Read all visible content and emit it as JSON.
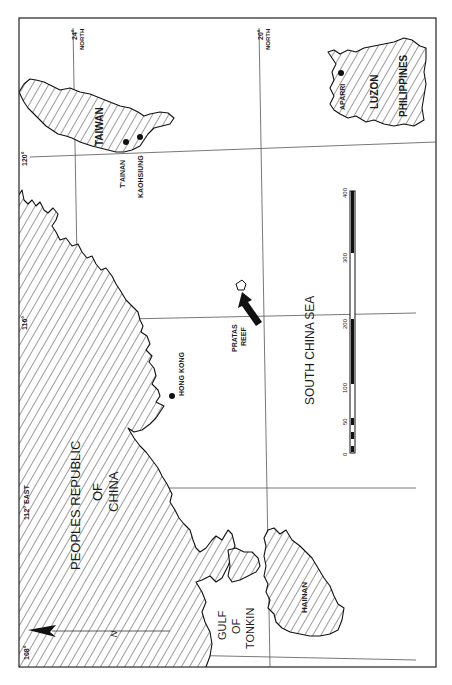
{
  "map": {
    "orientation": "rotated 90 degrees counter-clockwise",
    "colors": {
      "ink": "#111111",
      "paper": "#ffffff",
      "grid": "#555555"
    },
    "regions": {
      "china": {
        "line1": "PEOPLES REPUBLIC",
        "line2": "OF",
        "line3": "CHINA"
      },
      "taiwan": "TAIWAN",
      "luzon": "LUZON",
      "philippines": "PHILIPPINES",
      "hainan": "HAINAN",
      "gulf": {
        "line1": "GULF",
        "line2": "OF",
        "line3": "TONKIN"
      },
      "sea": "SOUTH CHINA SEA"
    },
    "places": {
      "hong_kong": "HONG KONG",
      "tainan": "T'AINAN",
      "kaohsiung": "KAOHSIUNG",
      "aparri": "APARRI",
      "pratas_line1": "PRATAS",
      "pratas_line2": "REEF"
    },
    "graticule": {
      "lat_24": "24°",
      "lat_24_dir": "NORTH",
      "lat_20": "20°",
      "lat_20_dir": "NORTH",
      "lon_120": "120°",
      "lon_116": "116°",
      "lon_112": "112°",
      "lon_112_dir": "EAST",
      "lon_108": "108°"
    },
    "north_arrow": {
      "symbol": "N",
      "icon": "north-arrow-icon"
    },
    "scale_bar": {
      "ticks": [
        "0",
        "50",
        "100",
        "200",
        "300",
        "400"
      ]
    },
    "pointer": {
      "icon": "arrow-icon",
      "target": "PRATAS REEF"
    }
  }
}
